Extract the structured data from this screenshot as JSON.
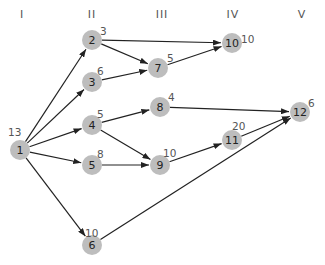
{
  "columns": [
    {
      "label": "I",
      "x": 22
    },
    {
      "label": "II",
      "x": 92
    },
    {
      "label": "III",
      "x": 162
    },
    {
      "label": "IV",
      "x": 233
    },
    {
      "label": "V",
      "x": 302
    }
  ],
  "colors": {
    "node_fill": "#bdbdbd",
    "edge": "#222222",
    "text": "#555555"
  },
  "nodes": [
    {
      "id": "1",
      "weight": "13",
      "x": 20,
      "y": 150,
      "wx": 8,
      "wy": 126
    },
    {
      "id": "2",
      "weight": "3",
      "x": 92,
      "y": 40,
      "wx": 100,
      "wy": 25
    },
    {
      "id": "3",
      "weight": "6",
      "x": 92,
      "y": 82,
      "wx": 97,
      "wy": 65
    },
    {
      "id": "4",
      "weight": "5",
      "x": 92,
      "y": 125,
      "wx": 97,
      "wy": 108
    },
    {
      "id": "5",
      "weight": "8",
      "x": 92,
      "y": 165,
      "wx": 97,
      "wy": 148
    },
    {
      "id": "6",
      "weight": "10",
      "x": 92,
      "y": 245,
      "wx": 85,
      "wy": 227
    },
    {
      "id": "7",
      "weight": "5",
      "x": 158,
      "y": 68,
      "wx": 167,
      "wy": 52
    },
    {
      "id": "8",
      "weight": "4",
      "x": 160,
      "y": 107,
      "wx": 168,
      "wy": 91
    },
    {
      "id": "9",
      "weight": "10",
      "x": 160,
      "y": 165,
      "wx": 163,
      "wy": 147
    },
    {
      "id": "10",
      "weight": "10",
      "x": 232,
      "y": 43,
      "wx": 241,
      "wy": 33
    },
    {
      "id": "11",
      "weight": "20",
      "x": 232,
      "y": 140,
      "wx": 232,
      "wy": 120
    },
    {
      "id": "12",
      "weight": "6",
      "x": 300,
      "y": 112,
      "wx": 308,
      "wy": 97
    }
  ],
  "edges": [
    {
      "from": "1",
      "to": "2"
    },
    {
      "from": "1",
      "to": "3"
    },
    {
      "from": "1",
      "to": "4"
    },
    {
      "from": "1",
      "to": "5"
    },
    {
      "from": "1",
      "to": "6"
    },
    {
      "from": "2",
      "to": "10"
    },
    {
      "from": "2",
      "to": "7"
    },
    {
      "from": "3",
      "to": "7"
    },
    {
      "from": "7",
      "to": "10"
    },
    {
      "from": "4",
      "to": "8"
    },
    {
      "from": "4",
      "to": "9"
    },
    {
      "from": "5",
      "to": "9"
    },
    {
      "from": "8",
      "to": "12"
    },
    {
      "from": "9",
      "to": "11"
    },
    {
      "from": "11",
      "to": "12"
    },
    {
      "from": "6",
      "to": "12"
    }
  ]
}
